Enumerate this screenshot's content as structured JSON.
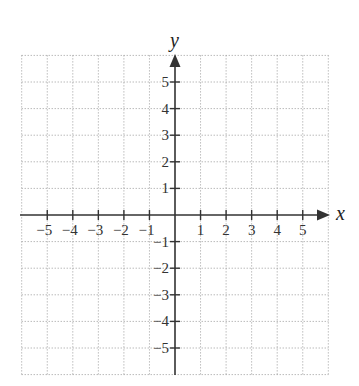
{
  "chart_data": {
    "type": "scatter",
    "title": "",
    "xlabel": "x",
    "ylabel": "y",
    "xlim": [
      -6,
      6
    ],
    "ylim": [
      -6,
      6
    ],
    "grid": true,
    "grid_style": "dotted",
    "x_ticks": [
      -5,
      -4,
      -3,
      -2,
      -1,
      1,
      2,
      3,
      4,
      5
    ],
    "y_ticks": [
      -5,
      -4,
      -3,
      -2,
      -1,
      1,
      2,
      3,
      4,
      5
    ],
    "x_tick_labels": [
      "−5",
      "−4",
      "−3",
      "−2",
      "−1",
      "1",
      "2",
      "3",
      "4",
      "5"
    ],
    "y_tick_labels": [
      "−5",
      "−4",
      "−3",
      "−2",
      "−1",
      "1",
      "2",
      "3",
      "4",
      "5"
    ],
    "series": [],
    "legend": null
  },
  "colors": {
    "axis": "#333333",
    "grid": "#9a9a9a",
    "background": "#ffffff"
  }
}
